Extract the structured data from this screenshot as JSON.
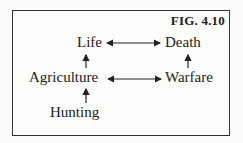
{
  "figure": {
    "label": "FIG. 4.10",
    "nodes": {
      "life": "Life",
      "death": "Death",
      "agriculture": "Agriculture",
      "warfare": "Warfare",
      "hunting": "Hunting"
    },
    "edges": [
      {
        "from": "Life",
        "to": "Death",
        "type": "bidirectional"
      },
      {
        "from": "Agriculture",
        "to": "Warfare",
        "type": "bidirectional"
      },
      {
        "from": "Agriculture",
        "to": "Life",
        "type": "directed"
      },
      {
        "from": "Warfare",
        "to": "Death",
        "type": "directed"
      },
      {
        "from": "Hunting",
        "to": "Agriculture",
        "type": "directed"
      }
    ]
  }
}
